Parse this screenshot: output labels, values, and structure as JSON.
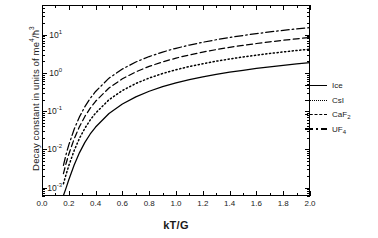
{
  "chart_data": {
    "type": "line",
    "title": "",
    "xlabel": "kT/G",
    "ylabel_parts": {
      "pre": "Decay constant in units of me",
      "sup1": "4",
      "mid": "/ħ",
      "sup2": "3"
    },
    "ylabel_plain": "Decay constant in units of me4/ħ3",
    "xlim": [
      0.0,
      2.0
    ],
    "ylim": [
      0.0006,
      60
    ],
    "yscale": "log",
    "grid": false,
    "legend_position": "right-outside",
    "xticks": [
      "0.0",
      "0.2",
      "0.4",
      "0.6",
      "0.8",
      "1.0",
      "1.2",
      "1.4",
      "1.6",
      "1.8",
      "2.0"
    ],
    "xtick_values": [
      0.0,
      0.2,
      0.4,
      0.6,
      0.8,
      1.0,
      1.2,
      1.4,
      1.6,
      1.8,
      2.0
    ],
    "ytick_labels": [
      {
        "mantissa": "10",
        "exp": "1"
      },
      {
        "mantissa": "10",
        "exp": "0"
      },
      {
        "mantissa": "10",
        "exp": "-1"
      },
      {
        "mantissa": "10",
        "exp": "-2"
      },
      {
        "mantissa": "10",
        "exp": "-3"
      }
    ],
    "ytick_values": [
      10,
      1,
      0.1,
      0.01,
      0.001
    ],
    "x": [
      0.16,
      0.18,
      0.2,
      0.24,
      0.28,
      0.32,
      0.36,
      0.4,
      0.5,
      0.6,
      0.7,
      0.8,
      0.9,
      1.0,
      1.1,
      1.2,
      1.3,
      1.4,
      1.5,
      1.6,
      1.7,
      1.8,
      1.9,
      2.0
    ],
    "series": [
      {
        "name": "Ice",
        "style": "solid",
        "values": [
          0.00062,
          0.00098,
          0.0016,
          0.0039,
          0.0082,
          0.0152,
          0.0252,
          0.0383,
          0.0869,
          0.1536,
          0.2365,
          0.3318,
          0.4365,
          0.5485,
          0.6662,
          0.7884,
          0.9142,
          1.043,
          1.1742,
          1.3073,
          1.4422,
          1.5784,
          1.716,
          1.8546
        ]
      },
      {
        "name": "CsI",
        "style": "dotted",
        "values": [
          0.00126,
          0.00222,
          0.00374,
          0.00932,
          0.0195,
          0.0357,
          0.0588,
          0.089,
          0.1985,
          0.3462,
          0.5276,
          0.7355,
          0.9646,
          1.2108,
          1.4711,
          1.743,
          2.0248,
          2.3152,
          2.6131,
          2.9176,
          3.2281,
          3.544,
          3.8649,
          4.1903
        ]
      },
      {
        "name": "CaF2",
        "style": "dashed",
        "values": [
          0.00232,
          0.00432,
          0.00744,
          0.0188,
          0.0396,
          0.0726,
          0.1196,
          0.181,
          0.403,
          0.701,
          1.0662,
          1.4843,
          1.9447,
          2.4399,
          2.964,
          3.5127,
          4.0825,
          4.6706,
          5.2748,
          5.8934,
          6.5248,
          7.1679,
          7.8215,
          8.4848
        ]
      },
      {
        "name": "UF4",
        "style": "dashdot",
        "values": [
          0.00382,
          0.00742,
          0.01304,
          0.0336,
          0.0712,
          0.131,
          0.216,
          0.3272,
          0.729,
          1.268,
          1.929,
          2.6854,
          3.5181,
          4.4131,
          5.3607,
          6.3536,
          7.3863,
          8.4543,
          9.5539,
          10.6824,
          11.8372,
          13.0164,
          14.2181,
          15.441
        ]
      }
    ],
    "legend": [
      {
        "label_pre": "Ice",
        "label_sub": "",
        "style": "solid"
      },
      {
        "label_pre": "CsI",
        "label_sub": "",
        "style": "dotted"
      },
      {
        "label_pre": "CaF",
        "label_sub": "2",
        "style": "dashed"
      },
      {
        "label_pre": "UF",
        "label_sub": "4",
        "style": "dashdot"
      }
    ]
  }
}
